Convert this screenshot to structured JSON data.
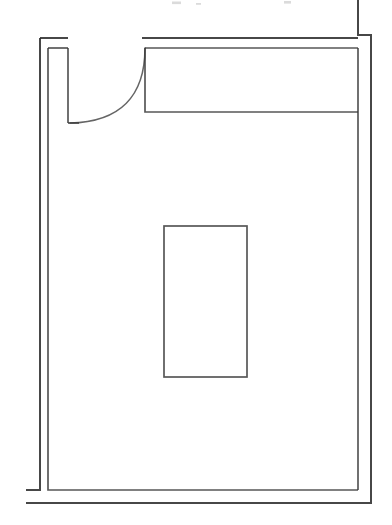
{
  "document": {
    "kind": "architectural-floor-plan",
    "title": "Floor Plan Line Drawing",
    "description": "Scanned black-and-white architectural floor plan of a single rectangular room with a double-line perimeter wall, a hinged door with swing arc at the upper left, a long built-in closet along the upper wall, and a freestanding rectangular fixture in the centre of the room.",
    "sheet_label": "",
    "scale_label": "",
    "north_label": ""
  },
  "canvas": {
    "width": 392,
    "height": 525,
    "background_color": "#ffffff",
    "ink_color": "#2d2d2d",
    "ink_opacity": "0.88"
  },
  "legend": {
    "visible": false,
    "entries": []
  },
  "annotations": {
    "dimension_strings": [],
    "room_names": [],
    "notes": []
  },
  "geometry": {
    "outer_wall": {
      "name": "outer-wall-line",
      "points": "40,38 40,490 26,490",
      "right_leg": "358,0 358,35 371,35 371,503 26,503",
      "top_left_stub": "40,38 68,38",
      "top_run": "142,38 358,38"
    },
    "inner_wall": {
      "name": "inner-wall-line",
      "left": "48,48 48,490",
      "bottom": "48,490 358,490",
      "right": "358,48 358,490",
      "top_closet_line": "145,48 358,48",
      "door_jamb": "68,48 68,123",
      "jamb_cap": "48,48 68,48"
    },
    "door": {
      "name": "door-swing",
      "hinge": [
        145,
        48
      ],
      "leaf_end": [
        70,
        123
      ],
      "radius": 75,
      "arc_path": "M145,48 C145,96 120,122 70,123"
    },
    "closet": {
      "name": "closet-outline",
      "x": 145,
      "y": 48,
      "width": 213,
      "height": 64,
      "bottom_line": "145,112 358,112"
    },
    "center_fixture": {
      "name": "center-fixture-outline",
      "x": 164,
      "y": 226,
      "width": 83,
      "height": 151
    },
    "scan_specks": [
      {
        "x": 172,
        "y": 2,
        "w": 9,
        "h": 3
      },
      {
        "x": 284,
        "y": 1,
        "w": 7,
        "h": 3
      },
      {
        "x": 196,
        "y": 3,
        "w": 5,
        "h": 2
      }
    ]
  }
}
